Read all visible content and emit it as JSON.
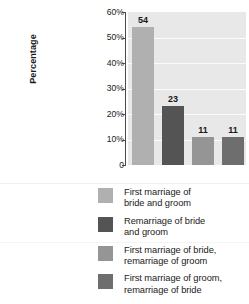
{
  "chart_data": {
    "type": "bar",
    "title": "",
    "xlabel": "",
    "ylabel": "Percentage",
    "ylim": [
      0,
      60
    ],
    "grid": true,
    "legend_position": "bottom",
    "categories": [
      "First marriage of bride and groom",
      "Remarriage of bride and groom",
      "First marriage of bride, remarriage of groom",
      "First marriage of groom, remarriage of bride"
    ],
    "values": [
      54,
      23,
      11,
      11
    ],
    "value_labels": [
      "54",
      "23",
      "11",
      "11"
    ],
    "colors": [
      "#b0b0b0",
      "#545454",
      "#959595",
      "#6e6e6e"
    ],
    "y_ticks": [
      0,
      10,
      20,
      30,
      40,
      50,
      60
    ],
    "y_tick_labels": [
      "0",
      "10%",
      "20%",
      "30%",
      "40%",
      "50%",
      "60%"
    ],
    "plot_background": "#e8e8e8",
    "gridline_color": "#fbfbfb",
    "axis_color": "#4a4a4a"
  },
  "axis": {
    "y_title": "Percentage",
    "tick_0": "0",
    "tick_10": "10%",
    "tick_20": "20%",
    "tick_30": "30%",
    "tick_40": "40%",
    "tick_50": "50%",
    "tick_60": "60%"
  },
  "bars": [
    {
      "label": "54",
      "value": 54,
      "color": "#b0b0b0"
    },
    {
      "label": "23",
      "value": 23,
      "color": "#545454"
    },
    {
      "label": "11",
      "value": 11,
      "color": "#959595"
    },
    {
      "label": "11",
      "value": 11,
      "color": "#6e6e6e"
    }
  ],
  "legend": {
    "items": [
      {
        "color": "#b0b0b0",
        "line1": "First marriage of",
        "line2": "bride and groom"
      },
      {
        "color": "#545454",
        "line1": "Remarriage of bride",
        "line2": "and groom"
      },
      {
        "color": "#959595",
        "line1": "First marriage of bride,",
        "line2": "remarriage of groom"
      },
      {
        "color": "#6e6e6e",
        "line1": "First marriage of groom,",
        "line2": "remarriage of bride"
      }
    ]
  }
}
